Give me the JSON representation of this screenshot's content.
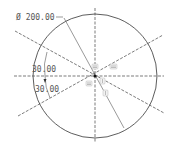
{
  "drawing": {
    "type": "sketch",
    "circle": {
      "cx": 95,
      "cy": 76,
      "r": 62
    },
    "dimensions": {
      "diameter": {
        "symbol": "Ø",
        "value": "200.00",
        "label": "Ø 200.00"
      },
      "angle_upper": {
        "value": "30.00"
      },
      "angle_lower": {
        "value": "30.00"
      }
    },
    "constraint_symbols": [
      "equal",
      "equal",
      "equal",
      "equal",
      "equal"
    ],
    "colors": {
      "geometry": "#333333",
      "text": "#555555",
      "background": "#ffffff"
    }
  }
}
